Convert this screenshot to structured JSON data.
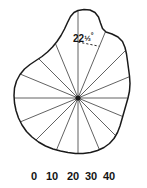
{
  "caption": {
    "text": "FIGURE 4-1.  MEASUREMENT",
    "clipped": true
  },
  "figure": {
    "center": {
      "x": 78,
      "y": 98
    },
    "ray_count": 16,
    "ray_interval_degrees": 22.5,
    "angle_annotation": {
      "value": "22",
      "fraction": "½",
      "degree_symbol": "°",
      "full_text": "22½°",
      "label_x": 73,
      "label_y": 30
    },
    "outline_color": "#1a1a1a",
    "ray_color": "#3a3a3a",
    "dash_color": "#2a2a2a",
    "background": "#ffffff",
    "outline_points": [
      [
        78.0,
        10.5
      ],
      [
        84.0,
        9.6
      ],
      [
        90.0,
        10.0
      ],
      [
        95.0,
        12.5
      ],
      [
        98.5,
        17.0
      ],
      [
        100.5,
        23.0
      ],
      [
        102.5,
        28.5
      ],
      [
        106.0,
        32.0
      ],
      [
        112.0,
        34.0
      ],
      [
        118.0,
        37.0
      ],
      [
        122.5,
        41.5
      ],
      [
        125.0,
        47.5
      ],
      [
        126.5,
        54.0
      ],
      [
        127.5,
        61.0
      ],
      [
        128.5,
        68.5
      ],
      [
        129.5,
        76.0
      ],
      [
        130.0,
        83.5
      ],
      [
        129.5,
        91.0
      ],
      [
        128.0,
        98.0
      ],
      [
        126.0,
        105.0
      ],
      [
        124.0,
        112.0
      ],
      [
        122.0,
        119.0
      ],
      [
        120.0,
        126.0
      ],
      [
        117.5,
        132.5
      ],
      [
        114.0,
        138.5
      ],
      [
        109.5,
        143.5
      ],
      [
        104.0,
        147.5
      ],
      [
        97.5,
        150.5
      ],
      [
        90.5,
        152.5
      ],
      [
        83.0,
        153.5
      ],
      [
        75.5,
        153.5
      ],
      [
        68.0,
        152.5
      ],
      [
        60.5,
        151.0
      ],
      [
        53.0,
        149.0
      ],
      [
        45.5,
        146.0
      ],
      [
        38.5,
        142.0
      ],
      [
        32.0,
        137.0
      ],
      [
        26.5,
        131.5
      ],
      [
        22.0,
        125.0
      ],
      [
        18.5,
        118.0
      ],
      [
        16.0,
        110.5
      ],
      [
        14.5,
        103.0
      ],
      [
        14.0,
        95.5
      ],
      [
        14.5,
        88.0
      ],
      [
        16.5,
        81.0
      ],
      [
        20.0,
        74.5
      ],
      [
        24.5,
        69.0
      ],
      [
        30.0,
        64.5
      ],
      [
        36.0,
        60.5
      ],
      [
        42.0,
        56.5
      ],
      [
        47.5,
        52.0
      ],
      [
        52.5,
        47.0
      ],
      [
        57.0,
        41.5
      ],
      [
        61.0,
        35.5
      ],
      [
        64.5,
        29.0
      ],
      [
        67.5,
        22.5
      ],
      [
        70.5,
        16.5
      ],
      [
        74.0,
        12.5
      ]
    ]
  },
  "scale": {
    "label": "scale",
    "ticks": [
      {
        "value": "0",
        "x": 34
      },
      {
        "value": "10",
        "x": 52
      },
      {
        "value": "20",
        "x": 73
      },
      {
        "value": "30",
        "x": 91
      },
      {
        "value": "40",
        "x": 109
      }
    ]
  }
}
